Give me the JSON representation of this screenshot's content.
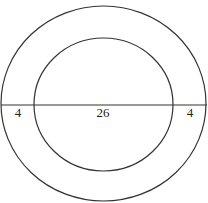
{
  "diagram": {
    "outer_circle": {
      "cx": 103.5,
      "cy": 103.5,
      "rx": 102.5,
      "ry": 97.5
    },
    "inner_circle": {
      "cx": 103.5,
      "cy": 104.5,
      "rx": 69.5,
      "ry": 66.5
    },
    "diameter_line": {
      "x1": 1,
      "x2": 207,
      "y": 105
    },
    "labels": [
      {
        "text": "4",
        "x": 18,
        "y": 117
      },
      {
        "text": "26",
        "x": 103,
        "y": 117
      },
      {
        "text": "4",
        "x": 190,
        "y": 117
      }
    ],
    "stroke_color": "#333333"
  }
}
